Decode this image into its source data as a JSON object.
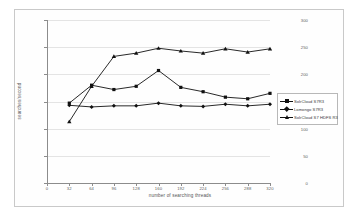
{
  "chart_data": {
    "type": "line",
    "title": "",
    "xlabel": "number of searching threads",
    "ylabel": "searches/second",
    "x": [
      32,
      64,
      96,
      128,
      160,
      192,
      224,
      256,
      288,
      320
    ],
    "xlim": [
      0,
      320
    ],
    "ylim": [
      0,
      300
    ],
    "xticks": [
      "0",
      "32",
      "64",
      "96",
      "128",
      "160",
      "192",
      "224",
      "256",
      "288",
      "320"
    ],
    "yticks": [
      "0",
      "50",
      "100",
      "150",
      "200",
      "250",
      "300"
    ],
    "grid": "horizontal",
    "legend_position": "right",
    "series": [
      {
        "name": "SolrCloud S7R3",
        "marker": "square",
        "color": "#111111",
        "values": [
          147,
          180,
          172,
          178,
          207,
          176,
          168,
          158,
          155,
          165
        ]
      },
      {
        "name": "Lomongo S7R3",
        "marker": "diamond",
        "color": "#111111",
        "values": [
          143,
          140,
          142,
          142,
          147,
          142,
          141,
          145,
          142,
          145
        ]
      },
      {
        "name": "SolrCloud S7 HDFS R3",
        "marker": "triangle",
        "color": "#111111",
        "values": [
          113,
          178,
          233,
          239,
          248,
          243,
          239,
          247,
          241,
          247
        ]
      }
    ]
  },
  "legend": {
    "entries": [
      "SolrCloud S7R3",
      "Lomongo S7R3",
      "SolrCloud S7 HDFS R3"
    ]
  }
}
